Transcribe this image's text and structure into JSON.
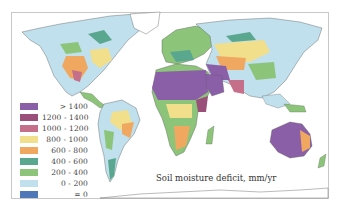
{
  "map": {
    "title": "Soil moisture deficit, mm/yr",
    "legend": [
      {
        "label": "> 1400",
        "color": "#8b5fa8"
      },
      {
        "label": "1200 - 1400",
        "color": "#9a4f7a"
      },
      {
        "label": "1000 - 1200",
        "color": "#c66f8a"
      },
      {
        "label": "800 - 1000",
        "color": "#f1df8c"
      },
      {
        "label": "600 - 800",
        "color": "#f0a860"
      },
      {
        "label": "400 - 600",
        "color": "#5aa78f"
      },
      {
        "label": "200 - 400",
        "color": "#8cc57a"
      },
      {
        "label": "0 - 200",
        "color": "#bfe0ec"
      },
      {
        "label": "= 0",
        "color": "#4f78b8"
      }
    ]
  }
}
